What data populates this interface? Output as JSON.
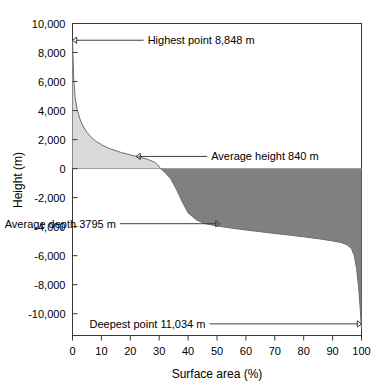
{
  "chart_data": {
    "type": "area",
    "title": "",
    "xlabel": "Surface area (%)",
    "ylabel": "Height (m)",
    "xlim": [
      0,
      100
    ],
    "ylim": [
      -11500,
      10000
    ],
    "grid": false,
    "legend": null,
    "x_ticks": [
      "0",
      "10",
      "20",
      "30",
      "40",
      "50",
      "60",
      "70",
      "80",
      "90",
      "100"
    ],
    "x_tick_values": [
      0,
      10,
      20,
      30,
      40,
      50,
      60,
      70,
      80,
      90,
      100
    ],
    "y_ticks": [
      "10,000",
      "8,000",
      "6,000",
      "4,000",
      "2,000",
      "0",
      "-2,000",
      "-4,000",
      "-6,000",
      "-8,000",
      "-10,000"
    ],
    "y_tick_values": [
      10000,
      8000,
      6000,
      4000,
      2000,
      0,
      -2000,
      -4000,
      -6000,
      -8000,
      -10000
    ],
    "series": [
      {
        "name": "Hypsographic curve",
        "fill_above_sea": "#d9d9d9",
        "fill_below_sea": "#808080",
        "x": [
          0,
          0.4,
          0.9,
          1.6,
          2.5,
          3.6,
          5,
          6.5,
          8,
          10,
          12,
          14,
          17,
          20,
          23,
          26,
          28.5,
          29.5,
          30.5,
          32,
          34,
          36,
          38,
          40,
          43,
          46,
          50,
          55,
          60,
          65,
          70,
          75,
          80,
          85,
          90,
          93,
          95,
          96.5,
          97.5,
          98.3,
          99,
          99.5,
          99.8,
          100
        ],
        "y": [
          8848,
          6300,
          4900,
          4100,
          3450,
          2950,
          2500,
          2150,
          1900,
          1650,
          1450,
          1300,
          1100,
          950,
          800,
          640,
          430,
          250,
          0,
          -260,
          -700,
          -1450,
          -2300,
          -3050,
          -3550,
          -3800,
          -3950,
          -4100,
          -4230,
          -4350,
          -4470,
          -4580,
          -4700,
          -4830,
          -4980,
          -5100,
          -5250,
          -5500,
          -6000,
          -6900,
          -8200,
          -9500,
          -10500,
          -11034
        ]
      }
    ],
    "annotations": [
      {
        "id": "highest-point",
        "text": "Highest point 8,848 m",
        "value": 8848,
        "units": "m",
        "target_x": 0,
        "target_y": 8848,
        "label_x": 26,
        "label_y": 9300,
        "arrow": "left"
      },
      {
        "id": "average-height",
        "text": "Average height 840 m",
        "value": 840,
        "units": "m",
        "target_x": 22,
        "target_y": 840,
        "label_x": 48,
        "label_y": 1300,
        "arrow": "left"
      },
      {
        "id": "average-depth",
        "text": "Average depth 3795 m",
        "value": -3795,
        "units": "m",
        "target_x": 51,
        "target_y": -3795,
        "label_x": 15,
        "label_y": -3500,
        "arrow": "right"
      },
      {
        "id": "deepest-point",
        "text": "Deepest point 11,034 m",
        "value": -11034,
        "units": "m",
        "target_x": 100,
        "target_y": -10700,
        "label_x": 46,
        "label_y": -10400,
        "arrow": "right"
      }
    ]
  },
  "colors": {
    "land_fill": "#d9d9d9",
    "ocean_fill": "#808080",
    "axis": "#3a3a3a",
    "text": "#000000",
    "background": "#ffffff"
  }
}
